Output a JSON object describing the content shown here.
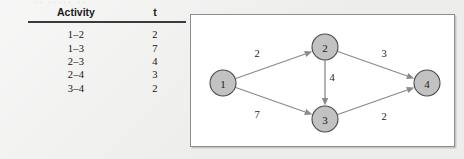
{
  "page": {
    "background_color": "#ededec",
    "remnant_text": "·· ····· ··"
  },
  "activity_table": {
    "headers": {
      "activity": "Activity",
      "time": "t"
    },
    "rows": [
      {
        "activity": "1–2",
        "t": "2"
      },
      {
        "activity": "1–3",
        "t": "7"
      },
      {
        "activity": "2–3",
        "t": "4"
      },
      {
        "activity": "2–4",
        "t": "3"
      },
      {
        "activity": "3–4",
        "t": "2"
      }
    ]
  },
  "diagram": {
    "type": "network-diagram",
    "panel_background": "#ffffff",
    "panel_border_color": "#8d8d8d",
    "node_fill": "#c2c2c2",
    "node_stroke": "#4a4a4a",
    "edge_color": "#8a8a8a",
    "nodes": [
      {
        "id": "1",
        "label": "1",
        "cx": 32,
        "cy": 68,
        "r": 13
      },
      {
        "id": "2",
        "label": "2",
        "cx": 134,
        "cy": 32,
        "r": 13
      },
      {
        "id": "3",
        "label": "3",
        "cx": 134,
        "cy": 104,
        "r": 13
      },
      {
        "id": "4",
        "label": "4",
        "cx": 236,
        "cy": 68,
        "r": 13
      }
    ],
    "edges": [
      {
        "from": "1",
        "to": "2",
        "label": "2",
        "label_x": 66,
        "label_y": 38
      },
      {
        "from": "1",
        "to": "3",
        "label": "7",
        "label_x": 66,
        "label_y": 99
      },
      {
        "from": "2",
        "to": "3",
        "label": "4",
        "label_x": 141,
        "label_y": 62
      },
      {
        "from": "2",
        "to": "4",
        "label": "3",
        "label_x": 193,
        "label_y": 38
      },
      {
        "from": "3",
        "to": "4",
        "label": "2",
        "label_x": 193,
        "label_y": 101
      }
    ]
  }
}
